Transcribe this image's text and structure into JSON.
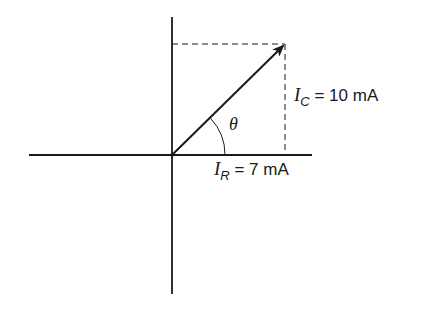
{
  "diagram": {
    "type": "phasor-diagram",
    "colors": {
      "line": "#1a1a1a",
      "background": "#ffffff"
    },
    "angle_label": "θ",
    "ic_label": {
      "symbol": "I",
      "subscript": "C",
      "value": "= 10 mA"
    },
    "ir_label": {
      "symbol": "I",
      "subscript": "R",
      "value": "= 7 mA"
    }
  }
}
